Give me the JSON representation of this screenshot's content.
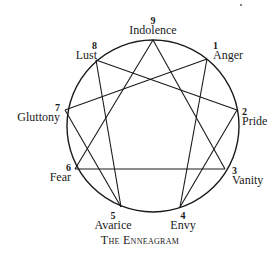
{
  "diagram": {
    "title": "The Enneagram",
    "circle": {
      "cx": 153,
      "cy": 126,
      "r": 86,
      "stroke": "#1a1a1a"
    },
    "points": [
      {
        "num": "9",
        "label": "Indolence",
        "x": 153,
        "y": 40
      },
      {
        "num": "1",
        "label": "Anger",
        "x": 207,
        "y": 59
      },
      {
        "num": "2",
        "label": "Pride",
        "x": 237,
        "y": 110
      },
      {
        "num": "3",
        "label": "Vanity",
        "x": 225,
        "y": 169
      },
      {
        "num": "4",
        "label": "Envy",
        "x": 180,
        "y": 207
      },
      {
        "num": "5",
        "label": "Avarice",
        "x": 121,
        "y": 207
      },
      {
        "num": "6",
        "label": "Fear",
        "x": 75,
        "y": 169
      },
      {
        "num": "7",
        "label": "Gluttony",
        "x": 65,
        "y": 110
      },
      {
        "num": "8",
        "label": "Lust",
        "x": 96,
        "y": 60
      }
    ],
    "triangle": [
      "9",
      "3",
      "6"
    ],
    "hexad": [
      "1",
      "4",
      "2",
      "8",
      "5",
      "7"
    ]
  }
}
